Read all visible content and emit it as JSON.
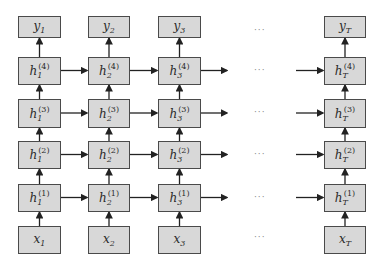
{
  "diagram": {
    "type": "deep-rnn-unrolled",
    "columns": [
      {
        "id": "1",
        "x": 18,
        "input": {
          "sym": "x",
          "sub": "1"
        },
        "output": {
          "sym": "y",
          "sub": "1"
        },
        "hidden": [
          {
            "sym": "h",
            "sub": "1",
            "sup": "(1)"
          },
          {
            "sym": "h",
            "sub": "1",
            "sup": "(2)"
          },
          {
            "sym": "h",
            "sub": "1",
            "sup": "(3)"
          },
          {
            "sym": "h",
            "sub": "1",
            "sup": "(4)"
          }
        ]
      },
      {
        "id": "2",
        "x": 88,
        "input": {
          "sym": "x",
          "sub": "2"
        },
        "output": {
          "sym": "y",
          "sub": "2"
        },
        "hidden": [
          {
            "sym": "h",
            "sub": "2",
            "sup": "(1)"
          },
          {
            "sym": "h",
            "sub": "2",
            "sup": "(2)"
          },
          {
            "sym": "h",
            "sub": "2",
            "sup": "(3)"
          },
          {
            "sym": "h",
            "sub": "2",
            "sup": "(4)"
          }
        ]
      },
      {
        "id": "3",
        "x": 158,
        "input": {
          "sym": "x",
          "sub": "3"
        },
        "output": {
          "sym": "y",
          "sub": "3"
        },
        "hidden": [
          {
            "sym": "h",
            "sub": "3",
            "sup": "(1)"
          },
          {
            "sym": "h",
            "sub": "3",
            "sup": "(2)"
          },
          {
            "sym": "h",
            "sub": "3",
            "sup": "(3)"
          },
          {
            "sym": "h",
            "sub": "3",
            "sup": "(4)"
          }
        ]
      },
      {
        "id": "T",
        "x": 324,
        "input": {
          "sym": "x",
          "sub": "T"
        },
        "output": {
          "sym": "y",
          "sub": "T"
        },
        "hidden": [
          {
            "sym": "h",
            "sub": "T",
            "sup": "(1)"
          },
          {
            "sym": "h",
            "sub": "T",
            "sup": "(2)"
          },
          {
            "sym": "h",
            "sub": "T",
            "sup": "(3)"
          },
          {
            "sym": "h",
            "sub": "T",
            "sup": "(4)"
          }
        ]
      }
    ],
    "ellipsis": "···",
    "colors": {
      "node_fill": "#d8d8d8",
      "node_border": "#4a4a4a",
      "arrow": "#222222",
      "ellipsis": "#888888"
    }
  }
}
